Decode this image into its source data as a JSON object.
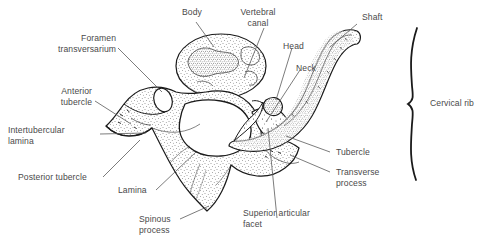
{
  "figure": {
    "background_color": "#ffffff",
    "ink_color": "#1a1a1a",
    "label_color": "#4a4a4a"
  },
  "labels": {
    "body": "Body",
    "vertebral_canal": "Vertebral\ncanal",
    "head": "Head",
    "neck": "Neck",
    "shaft": "Shaft",
    "cervical_rib": "Cervical rib",
    "foramen_transversarium": "Foramen\ntransversarium",
    "anterior_tubercle": "Anterior\ntubercle",
    "intertubercular_lamina": "Intertubercular\nlamina",
    "posterior_tubercle": "Posterior tubercle",
    "lamina": "Lamina",
    "spinous_process": "Spinous\nprocess",
    "superior_articular_facet": "Superior articular\nfacet",
    "tubercle": "Tubercle",
    "transverse_process": "Transverse\nprocess"
  }
}
